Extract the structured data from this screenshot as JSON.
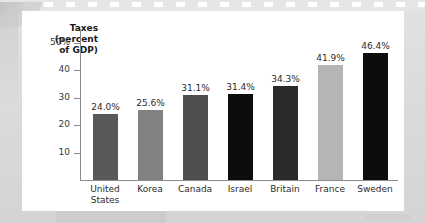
{
  "chart_data": {
    "type": "bar",
    "title": "",
    "subtitle": "",
    "xlabel": "",
    "ylabel": "Taxes (percent of GDP)",
    "ylabel_lines": [
      "Taxes",
      "(percent",
      "of GDP)"
    ],
    "categories": [
      "United States",
      "Korea",
      "Canada",
      "Israel",
      "Britain",
      "France",
      "Sweden"
    ],
    "category_lines": [
      [
        "United",
        "States"
      ],
      [
        "Korea"
      ],
      [
        "Canada"
      ],
      [
        "Israel"
      ],
      [
        "Britain"
      ],
      [
        "France"
      ],
      [
        "Sweden"
      ]
    ],
    "values": [
      24.0,
      25.6,
      31.1,
      31.4,
      34.3,
      41.9,
      46.4
    ],
    "value_labels": [
      "24.0%",
      "25.6%",
      "31.1%",
      "31.4%",
      "34.3%",
      "41.9%",
      "46.4%"
    ],
    "bar_colors": [
      "#595959",
      "#818181",
      "#4f4f4f",
      "#0d0d0d",
      "#2b2b2b",
      "#b5b5b5",
      "#0d0d0d"
    ],
    "ylim": [
      0,
      55
    ],
    "yticks": [
      10,
      20,
      30,
      40,
      50
    ],
    "ytick_labels": [
      "10",
      "20",
      "30",
      "40",
      "50%"
    ],
    "grid": false,
    "legend": "none",
    "axis_color": "#8b8b8b"
  },
  "figure": {
    "background_color": "#d9d9d9",
    "card_color": "#ffffff",
    "filmstrip_color": "#e6e6e6"
  }
}
